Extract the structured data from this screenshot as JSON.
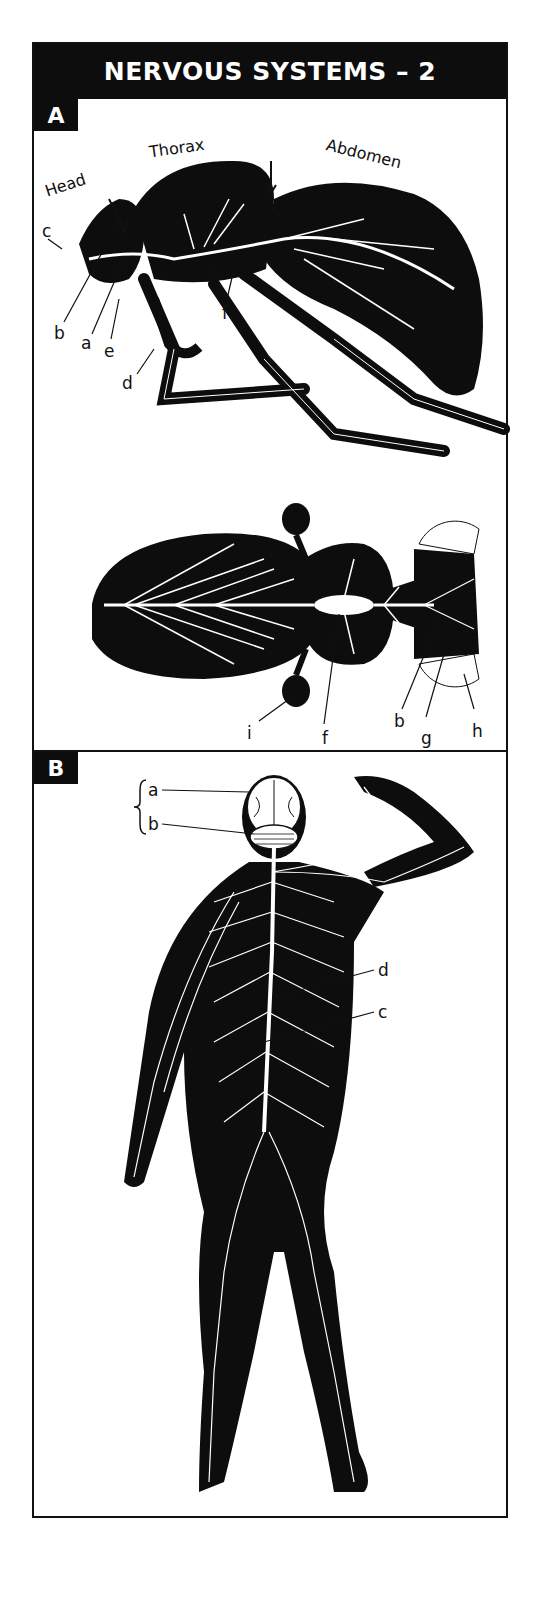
{
  "title": "NERVOUS SYSTEMS – 2",
  "panels": {
    "a": {
      "label": "A",
      "side_view": {
        "regions": [
          "Head",
          "Thorax",
          "Abdomen"
        ],
        "labels": [
          "c",
          "b",
          "a",
          "e",
          "d",
          "f"
        ]
      },
      "top_view": {
        "labels": [
          "i",
          "f",
          "b",
          "g",
          "h"
        ]
      }
    },
    "b": {
      "label": "B",
      "labels": [
        "a",
        "b",
        "d",
        "c"
      ]
    }
  },
  "colors": {
    "ink": "#0d0d0d",
    "paper": "#ffffff"
  }
}
